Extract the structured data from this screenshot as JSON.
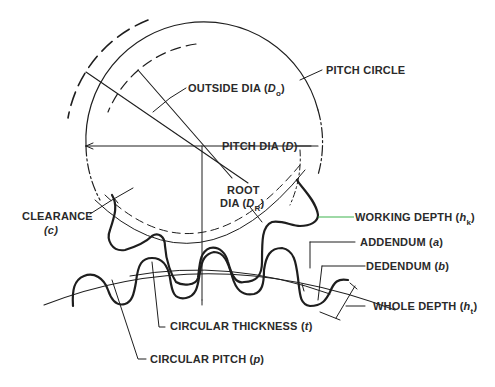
{
  "diagram": {
    "colors": {
      "line": "#1e1e1e",
      "text": "#2a2a2a",
      "working_depth_leader": "#3fb34f",
      "background": "#ffffff"
    },
    "labels": {
      "pitch_circle": "PITCH CIRCLE",
      "outside_dia": {
        "text": "OUTSIDE DIA (",
        "symbol": "D",
        "subscript": "o",
        "close": ")"
      },
      "pitch_dia": {
        "text": "PITCH DIA (",
        "symbol": "D",
        "close": ")"
      },
      "root_dia": {
        "line1": "ROOT",
        "text": "DIA (",
        "symbol": "D",
        "subscript": "R",
        "close": ")"
      },
      "clearance": {
        "line1": "CLEARANCE",
        "line2": "(c)"
      },
      "working_depth": {
        "text": "WORKING DEPTH (",
        "symbol": "h",
        "subscript": "k",
        "close": ")"
      },
      "addendum": {
        "text": "ADDENDUM (",
        "symbol": "a",
        "close": ")"
      },
      "dedendum": {
        "text": "DEDENDUM (",
        "symbol": "b",
        "close": ")"
      },
      "whole_depth": {
        "text": "WHOLE DEPTH (",
        "symbol": "h",
        "subscript": "t",
        "close": ")"
      },
      "circular_thickness": {
        "text": "CIRCULAR THICKNESS  (",
        "symbol": "t",
        "close": ")"
      },
      "circular_pitch": {
        "text": "CIRCULAR PITCH (",
        "symbol": "p",
        "close": ")"
      }
    }
  }
}
